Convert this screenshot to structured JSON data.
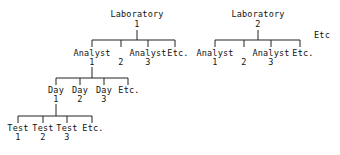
{
  "diagram": {
    "type": "hierarchy-tree",
    "line_color": "#222222",
    "trees": [
      {
        "root": {
          "label": "Laboratory",
          "number": "1"
        },
        "analysts": [
          {
            "label": "Analyst",
            "number": "1"
          },
          {
            "label": "",
            "number": "2"
          },
          {
            "label": "Analyst",
            "number": "3"
          },
          {
            "label": "Etc.",
            "number": ""
          }
        ],
        "days": [
          {
            "label": "Day",
            "number": "1"
          },
          {
            "label": "Day",
            "number": "2"
          },
          {
            "label": "Day",
            "number": "3"
          },
          {
            "label": "Etc.",
            "number": ""
          }
        ],
        "tests": [
          {
            "label": "Test",
            "number": "1"
          },
          {
            "label": "Test",
            "number": "2"
          },
          {
            "label": "Test",
            "number": "3"
          },
          {
            "label": "Etc.",
            "number": ""
          }
        ]
      },
      {
        "root": {
          "label": "Laboratory",
          "number": "2"
        },
        "analysts": [
          {
            "label": "Analyst",
            "number": "1"
          },
          {
            "label": "",
            "number": "2"
          },
          {
            "label": "Analyst",
            "number": "3"
          },
          {
            "label": "Etc.",
            "number": ""
          }
        ]
      }
    ],
    "laboratory_etc": "Etc"
  }
}
